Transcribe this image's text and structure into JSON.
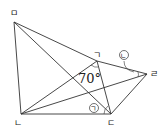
{
  "diagram": {
    "points": {
      "giyeok": {
        "label": "ㄱ",
        "x": 97,
        "y": 61
      },
      "nieun": {
        "label": "ㄴ",
        "x": 21,
        "y": 114
      },
      "digeut": {
        "label": "ㄷ",
        "x": 111,
        "y": 114
      },
      "rieul": {
        "label": "ㄹ",
        "x": 147,
        "y": 74
      },
      "mieum": {
        "label": "ㅁ",
        "x": 14,
        "y": 22
      }
    },
    "angle_label": "70°",
    "marked_angles": {
      "a": "ㄱ",
      "b": "ㄴ"
    },
    "line_color": "#333333"
  }
}
